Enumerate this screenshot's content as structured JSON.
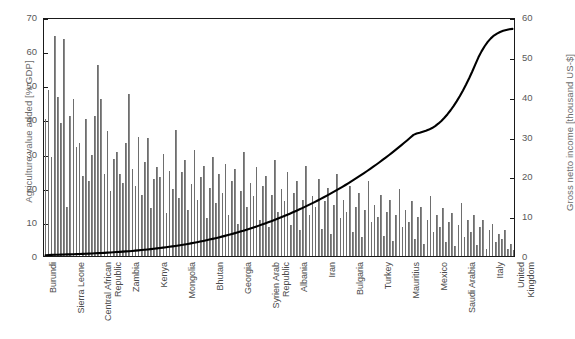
{
  "chart_data": {
    "type": "bar",
    "title": "",
    "subtitle": "",
    "xlabel": "",
    "ylabel": "Agriculture value added [% GDP]",
    "y2label": "Gross netto income [thousand US-$]",
    "ylim": [
      0,
      70
    ],
    "y2lim": [
      0,
      60
    ],
    "yticks": [
      0,
      10,
      20,
      30,
      40,
      50,
      60,
      70
    ],
    "y2ticks": [
      0,
      10,
      20,
      30,
      40,
      50,
      60
    ],
    "grid": false,
    "legend": null,
    "bar_color": "#8a8a8a",
    "line_color": "#000000",
    "frame_color": "#1a1a1a",
    "background": "#ffffff",
    "x_tick_labels": [
      {
        "index": 0,
        "label": "Burundi"
      },
      {
        "index": 9,
        "label": "Sierra Leone"
      },
      {
        "index": 18,
        "label": "Central African\nRepublic"
      },
      {
        "index": 27,
        "label": "Zambia"
      },
      {
        "index": 36,
        "label": "Kenya"
      },
      {
        "index": 45,
        "label": "Mongolia"
      },
      {
        "index": 54,
        "label": "Bhutan"
      },
      {
        "index": 63,
        "label": "Georgia"
      },
      {
        "index": 72,
        "label": "Syrien Arab\nRepublic"
      },
      {
        "index": 81,
        "label": "Albania"
      },
      {
        "index": 90,
        "label": "Iran"
      },
      {
        "index": 99,
        "label": "Bulgaria"
      },
      {
        "index": 108,
        "label": "Turkey"
      },
      {
        "index": 117,
        "label": "Mauritius"
      },
      {
        "index": 126,
        "label": "Mexico"
      },
      {
        "index": 135,
        "label": "Saudi Arabia"
      },
      {
        "index": 144,
        "label": "Italy"
      },
      {
        "index": 151,
        "label": "United\nKingdom"
      }
    ],
    "series": [
      {
        "name": "Agriculture value added [% GDP]",
        "type": "bar",
        "axis": "left",
        "values": [
          40.0,
          48.5,
          29.0,
          64.5,
          46.5,
          39.0,
          63.5,
          14.5,
          41.0,
          46.0,
          32.0,
          33.0,
          23.5,
          40.0,
          22.0,
          29.5,
          41.0,
          56.0,
          46.0,
          24.0,
          36.5,
          19.0,
          28.5,
          30.5,
          24.0,
          21.5,
          33.0,
          47.5,
          25.5,
          20.5,
          35.0,
          18.0,
          27.5,
          34.5,
          14.0,
          22.5,
          26.0,
          23.0,
          30.0,
          12.5,
          25.0,
          19.5,
          37.0,
          17.0,
          24.5,
          28.0,
          13.5,
          21.0,
          31.0,
          16.5,
          23.0,
          26.5,
          11.0,
          20.0,
          29.0,
          15.5,
          24.0,
          18.5,
          27.0,
          12.0,
          22.0,
          25.5,
          9.5,
          19.0,
          30.5,
          14.5,
          21.5,
          17.5,
          26.0,
          10.5,
          20.5,
          23.5,
          8.5,
          18.0,
          28.0,
          13.0,
          19.5,
          16.0,
          24.5,
          9.0,
          18.5,
          22.0,
          7.5,
          16.5,
          26.5,
          12.0,
          17.5,
          14.5,
          22.5,
          8.0,
          16.0,
          20.0,
          6.5,
          15.0,
          24.0,
          11.0,
          16.5,
          13.0,
          20.5,
          7.0,
          14.5,
          18.5,
          5.5,
          13.5,
          22.0,
          10.0,
          15.0,
          11.5,
          18.0,
          6.0,
          13.0,
          16.5,
          4.5,
          12.0,
          19.5,
          8.5,
          13.5,
          10.0,
          16.0,
          5.0,
          11.5,
          14.5,
          3.5,
          10.5,
          17.5,
          7.0,
          12.0,
          8.5,
          14.0,
          4.0,
          10.0,
          12.5,
          2.8,
          9.0,
          15.5,
          5.5,
          10.5,
          7.0,
          12.0,
          3.2,
          8.5,
          10.5,
          2.2,
          7.5,
          9.5,
          4.2,
          6.5,
          5.0,
          7.5,
          2.0,
          3.5,
          1.8
        ]
      },
      {
        "name": "Gross netto income [thousand US-$]",
        "type": "line",
        "axis": "right",
        "values": [
          0.2,
          0.25,
          0.28,
          0.3,
          0.32,
          0.35,
          0.38,
          0.4,
          0.42,
          0.45,
          0.48,
          0.5,
          0.53,
          0.56,
          0.6,
          0.64,
          0.68,
          0.72,
          0.76,
          0.8,
          0.85,
          0.9,
          0.95,
          1.0,
          1.05,
          1.1,
          1.16,
          1.22,
          1.28,
          1.35,
          1.42,
          1.5,
          1.58,
          1.66,
          1.75,
          1.84,
          1.93,
          2.02,
          2.12,
          2.22,
          2.33,
          2.44,
          2.55,
          2.67,
          2.8,
          2.93,
          3.06,
          3.2,
          3.35,
          3.5,
          3.66,
          3.82,
          3.99,
          4.16,
          4.34,
          4.52,
          4.71,
          4.9,
          5.1,
          5.3,
          5.51,
          5.73,
          5.95,
          6.18,
          6.42,
          6.66,
          6.91,
          7.16,
          7.42,
          7.69,
          7.96,
          8.24,
          8.53,
          8.82,
          9.12,
          9.43,
          9.74,
          10.06,
          10.39,
          10.72,
          11.06,
          11.41,
          11.76,
          12.12,
          12.49,
          12.87,
          13.25,
          13.64,
          14.04,
          14.45,
          14.86,
          15.28,
          15.71,
          16.15,
          16.6,
          17.05,
          17.51,
          17.98,
          18.46,
          18.95,
          19.45,
          19.95,
          20.47,
          20.99,
          21.52,
          22.06,
          22.61,
          23.17,
          23.74,
          24.32,
          24.91,
          25.51,
          26.12,
          26.74,
          27.37,
          28.01,
          28.66,
          29.32,
          29.99,
          30.67,
          31.0,
          31.2,
          31.45,
          31.7,
          32.0,
          32.4,
          32.9,
          33.5,
          34.2,
          35.0,
          35.9,
          36.9,
          38.0,
          39.2,
          40.5,
          41.9,
          43.4,
          45.0,
          46.7,
          48.5,
          50.3,
          51.8,
          53.1,
          54.2,
          55.1,
          55.8,
          56.3,
          56.7,
          57.0,
          57.2,
          57.4,
          57.5
        ]
      }
    ]
  }
}
